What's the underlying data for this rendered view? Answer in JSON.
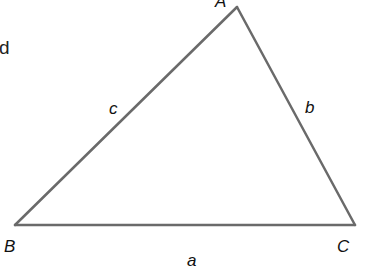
{
  "diagram": {
    "type": "triangle",
    "stroke_color": "#6a6a6a",
    "stroke_width": 2.5,
    "vertices": [
      {
        "name": "A",
        "x": 237,
        "y": 7
      },
      {
        "name": "B",
        "x": 15,
        "y": 225
      },
      {
        "name": "C",
        "x": 355,
        "y": 225
      }
    ],
    "vertex_labels": {
      "A": "A",
      "B": "B",
      "C": "C"
    },
    "side_labels": {
      "a": "a",
      "b": "b",
      "c": "c"
    },
    "partial_text": "d"
  }
}
